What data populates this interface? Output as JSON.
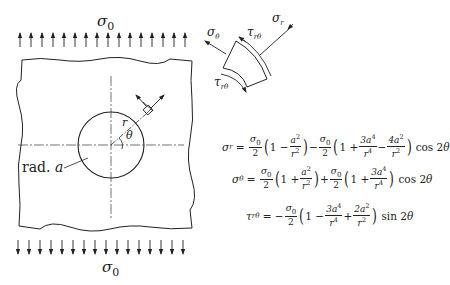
{
  "figure": {
    "type": "plate-with-circular-hole-under-uniaxial-tension",
    "top_load_label": "σ",
    "top_load_sub": "0",
    "bottom_load_label": "σ",
    "bottom_load_sub": "0",
    "arrow_count_top": 16,
    "arrow_count_bottom": 16,
    "hole_label": "rad. ",
    "hole_label_var": "a",
    "radius_label": "r",
    "angle_label": "θ"
  },
  "element": {
    "sigma_r": {
      "sym": "σ",
      "sub": "r"
    },
    "sigma_theta": {
      "sym": "σ",
      "sub": "θ"
    },
    "tau_top": {
      "sym": "τ",
      "sub": "rθ"
    },
    "tau_bottom": {
      "sym": "τ",
      "sub": "rθ"
    }
  },
  "equations": {
    "eq1": {
      "lhs": "σ",
      "lhs_sub": "r",
      "t1_num": "σ",
      "t1_num_sub": "0",
      "t1_den": "2",
      "p1_a": "1 − ",
      "p1_num": "a",
      "p1_num_sup": "2",
      "p1_den": "r",
      "p1_den_sup": "2",
      "op": "−",
      "t2_num": "σ",
      "t2_num_sub": "0",
      "t2_den": "2",
      "p2_a": "1 + ",
      "p2_f1_num": "3a",
      "p2_f1_num_sup": "4",
      "p2_f1_den": "r",
      "p2_f1_den_sup": "4",
      "p2_op": " − ",
      "p2_f2_num": "4a",
      "p2_f2_num_sup": "2",
      "p2_f2_den": "r",
      "p2_f2_den_sup": "2",
      "trig": "cos 2",
      "trig_var": "θ"
    },
    "eq2": {
      "lhs": "σ",
      "lhs_sub": "θ",
      "t1_num": "σ",
      "t1_num_sub": "0",
      "t1_den": "2",
      "p1_a": "1 + ",
      "p1_num": "a",
      "p1_num_sup": "2",
      "p1_den": "r",
      "p1_den_sup": "2",
      "op": "+",
      "t2_num": "σ",
      "t2_num_sub": "0",
      "t2_den": "2",
      "p2_a": "1 + ",
      "p2_f1_num": "3a",
      "p2_f1_num_sup": "4",
      "p2_f1_den": "r",
      "p2_f1_den_sup": "4",
      "trig": "cos 2",
      "trig_var": "θ"
    },
    "eq3": {
      "lhs": "τ",
      "lhs_sub": "rθ",
      "neg": "−",
      "t1_num": "σ",
      "t1_num_sub": "0",
      "t1_den": "2",
      "p1_a": "1 − ",
      "p1_f1_num": "3a",
      "p1_f1_num_sup": "4",
      "p1_f1_den": "r",
      "p1_f1_den_sup": "4",
      "p1_op": " + ",
      "p1_f2_num": "2a",
      "p1_f2_num_sup": "2",
      "p1_f2_den": "r",
      "p1_f2_den_sup": "2",
      "trig": "sin 2",
      "trig_var": "θ"
    }
  }
}
